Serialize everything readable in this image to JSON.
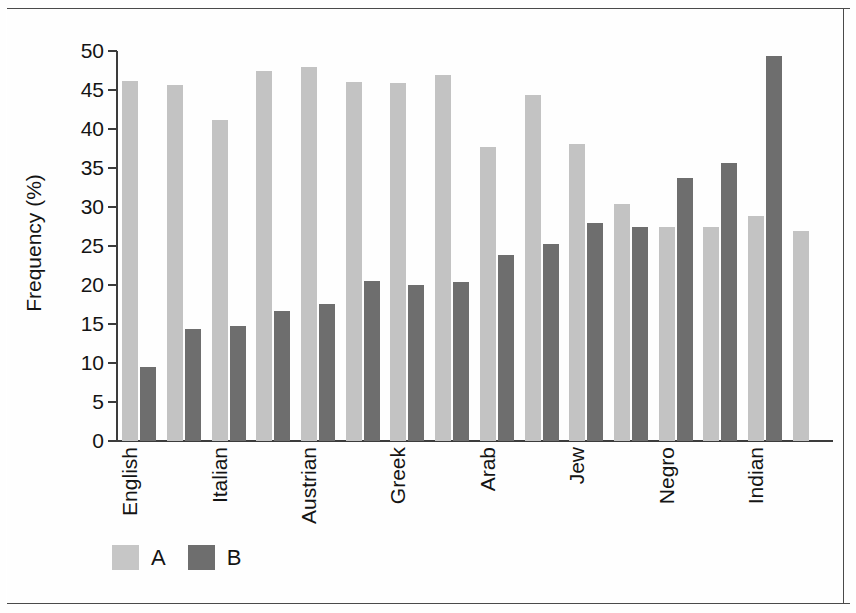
{
  "chart_data": {
    "type": "bar",
    "title": "",
    "xlabel": "",
    "ylabel": "Frequency (%)",
    "ylim": [
      0,
      50
    ],
    "ytick_labels": [
      "50",
      "45",
      "40",
      "35",
      "30",
      "25",
      "20",
      "15",
      "10",
      "5",
      "0"
    ],
    "ytick_values": [
      50,
      45,
      40,
      35,
      30,
      25,
      20,
      15,
      10,
      5,
      0
    ],
    "grid": false,
    "legend_position": "bottom-left",
    "categories": [
      "English",
      "",
      "Italian",
      "",
      "Austrian",
      "",
      "Greek",
      "",
      "Arab",
      "",
      "Jew",
      "",
      "Negro",
      "",
      "Indian",
      ""
    ],
    "tick_labelled_groups": [
      0,
      2,
      4,
      6,
      8,
      10,
      12,
      14
    ],
    "group_labels": [
      "English",
      "Italian",
      "Austrian",
      "Greek",
      "Arab",
      "Jew",
      "Negro",
      "Indian"
    ],
    "series": [
      {
        "name": "A",
        "color": "#c3c3c3",
        "values": [
          46.1,
          45.6,
          41.2,
          47.4,
          47.9,
          46.0,
          45.9,
          46.9,
          37.7,
          44.3,
          38.1,
          30.4,
          27.4,
          27.4,
          28.9,
          26.9
        ]
      },
      {
        "name": "B",
        "color": "#6e6e6e",
        "values": [
          9.5,
          14.3,
          14.8,
          16.7,
          17.6,
          20.5,
          20.0,
          20.4,
          23.8,
          25.2,
          27.9,
          27.4,
          33.7,
          35.6,
          49.4,
          0
        ]
      }
    ],
    "legend": [
      {
        "label": "A",
        "color": "#c6c6c6"
      },
      {
        "label": "B",
        "color": "#6e6e6e"
      }
    ]
  },
  "colors": {
    "series_a": "#c3c3c3",
    "series_b": "#6e6e6e",
    "axis": "#3c3c3c",
    "text": "#141414",
    "background": "#ffffff"
  }
}
